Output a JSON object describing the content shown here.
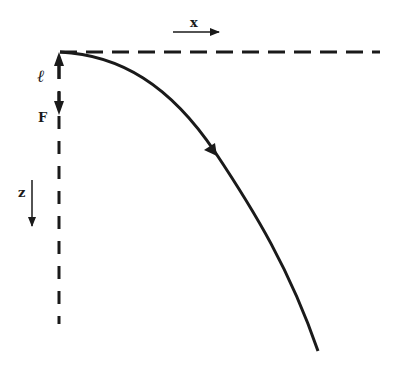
{
  "diagram": {
    "labels": {
      "x_axis": "x",
      "z_axis": "z",
      "length": "ℓ",
      "force": "F"
    },
    "colors": {
      "stroke": "#1a1a1a",
      "background": "#ffffff"
    },
    "elements": {
      "horizontal_reference": "dashed line",
      "vertical_reference": "dashed line",
      "curve": "deflection curve with direction arrow"
    }
  }
}
